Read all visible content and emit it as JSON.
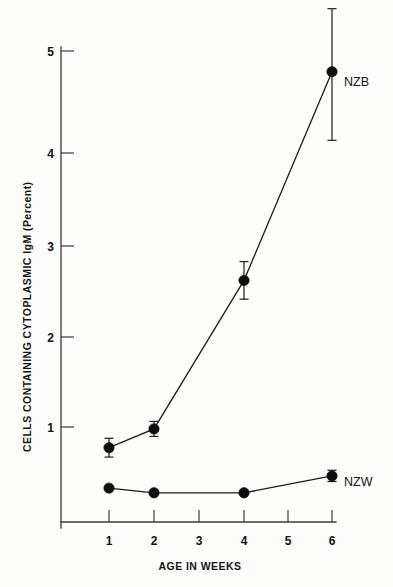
{
  "chart_data": {
    "type": "line",
    "title": "",
    "subtitle": "",
    "xlabel": "AGE IN WEEKS",
    "ylabel": "CELLS CONTAINING CYTOPLASMIC IgM (Percent)",
    "x": [
      1,
      2,
      4,
      6
    ],
    "xticks": [
      1,
      2,
      3,
      4,
      5,
      6
    ],
    "xtick_labels": [
      "1",
      "2",
      "3",
      "4",
      "5",
      "6"
    ],
    "yticks": [
      1,
      2,
      3,
      4,
      5
    ],
    "ytick_labels": [
      "1",
      "2",
      "3",
      "4",
      "5"
    ],
    "xlim": [
      0.3,
      6.5
    ],
    "ylim": [
      0.0,
      5.45
    ],
    "grid": false,
    "legend_position": "inline-right-of-last-point",
    "series": [
      {
        "name": "NZB",
        "label": "NZB",
        "marker": "filled-circle",
        "color": "#0d0d0d",
        "x": [
          1,
          2,
          4,
          6
        ],
        "values": [
          0.78,
          0.98,
          2.56,
          4.78
        ],
        "err_upper": [
          0.1,
          0.08,
          0.2,
          0.67
        ],
        "err_lower": [
          0.1,
          0.08,
          0.2,
          0.73
        ]
      },
      {
        "name": "NZW",
        "label": "NZW",
        "marker": "filled-circle",
        "color": "#0d0d0d",
        "x": [
          1,
          2,
          4,
          6
        ],
        "values": [
          0.35,
          0.3,
          0.3,
          0.48
        ],
        "err_upper": [
          0.0,
          0.0,
          0.0,
          0.06
        ],
        "err_lower": [
          0.0,
          0.0,
          0.0,
          0.06
        ]
      }
    ]
  },
  "figure": {
    "background_color": "#fdfdfc",
    "ink_color": "#111111"
  }
}
